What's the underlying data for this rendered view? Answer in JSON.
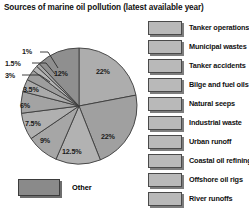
{
  "chart_data": {
    "type": "pie",
    "title": "Sources of marine oil pollution (latest available year)",
    "xlabel": "",
    "ylabel": "",
    "legend_position": "right",
    "grid": false,
    "categories": [
      "Tanker operations",
      "Municipal wastes",
      "Tanker accidents",
      "Bilge and fuel oils",
      "Natural seeps",
      "Industrial waste",
      "Urban runoff",
      "Coastal oil refining",
      "Offshore oil rigs",
      "River runoffs",
      "Other"
    ],
    "values": [
      22,
      22,
      12.5,
      9,
      7.5,
      6,
      3.5,
      3,
      1.5,
      1,
      12
    ],
    "value_labels": [
      "22%",
      "22%",
      "12.5%",
      "9%",
      "7.5%",
      "6%",
      "3.5%",
      "3%",
      "1.5%",
      "1%",
      "12%"
    ],
    "slice_colors": [
      "#adadad",
      "#a0a0a0",
      "#b2b2b2",
      "#a6a6a6",
      "#b0b0b0",
      "#a3a3a3",
      "#aaaaaa",
      "#9e9e9e",
      "#b4b4b4",
      "#a8a8a8",
      "#8f8f8f"
    ]
  },
  "slice_labels": {
    "tanker_operations": "22%",
    "municipal_wastes": "22%",
    "tanker_accidents": "12.5%",
    "bilge_and_fuel_oils": "9%",
    "natural_seeps": "7.5%",
    "industrial_waste": "6%",
    "urban_runoff": "3.5%",
    "coastal_oil_refining": "3%",
    "offshore_oil_rigs": "1.5%",
    "river_runoffs": "1%",
    "other": "12%"
  },
  "legend": {
    "items": [
      {
        "label": "Tanker operations"
      },
      {
        "label": "Municipal wastes"
      },
      {
        "label": "Tanker accidents"
      },
      {
        "label": "Bilge and fuel oils"
      },
      {
        "label": "Natural seeps"
      },
      {
        "label": "Industrial waste"
      },
      {
        "label": "Urban runoff"
      },
      {
        "label": "Coastal oil refining"
      },
      {
        "label": "Offshore oil rigs"
      },
      {
        "label": "River runoffs"
      }
    ],
    "other_label": "Other"
  },
  "colors": {
    "background": "#ffffff",
    "swatch_fill": "#b9b9b9",
    "swatch_border": "#4a4a4a",
    "swatch_shadow": "#7d7d7d",
    "other_swatch_fill": "#8a8a8a",
    "slice_outline": "#3c3c3c",
    "text": "#111111"
  }
}
